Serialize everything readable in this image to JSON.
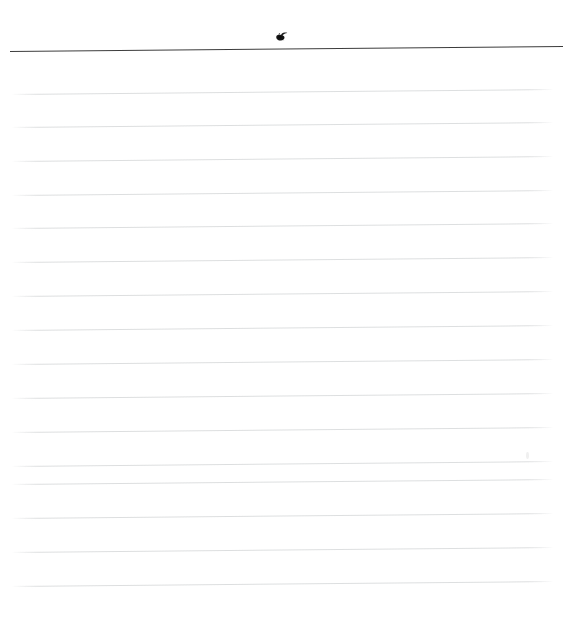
{
  "document": {
    "kind": "scanned-ruled-notebook-page",
    "description": "Blank lined paper scan",
    "width": 578,
    "height": 638,
    "background_color": "#ffffff",
    "content_text": ""
  },
  "header_rule": {
    "name": "header-rule",
    "color": "#2b2b2b",
    "thickness_px": 1.6,
    "x_start": 10,
    "x_end": 563,
    "y": 50.5,
    "tilt_deg": -0.52
  },
  "ink_blot": {
    "name": "ink-blot-mark",
    "color": "#1a1a1a",
    "x": 274,
    "y": 29,
    "width": 14,
    "height": 12
  },
  "speck": {
    "name": "scan-speck-artifact",
    "color": "#eeeeee",
    "x": 526,
    "y": 452
  },
  "ruled_lines": {
    "name": "ruled-lines",
    "count": 16,
    "color": "#d7d9da",
    "thickness_px": 1,
    "spacing_px": 33.9,
    "x_start": 12,
    "x_end": 553,
    "tilt_deg": -0.52,
    "y_positions": [
      93.5,
      127.0,
      160.5,
      194.5,
      228.0,
      262.0,
      296.0,
      330.0,
      364.0,
      398.0,
      432.0,
      465.5,
      484.0,
      518.0,
      552.0,
      586.0
    ]
  },
  "bottom_margin": {
    "name": "bottom-margin",
    "height_px": 52
  }
}
